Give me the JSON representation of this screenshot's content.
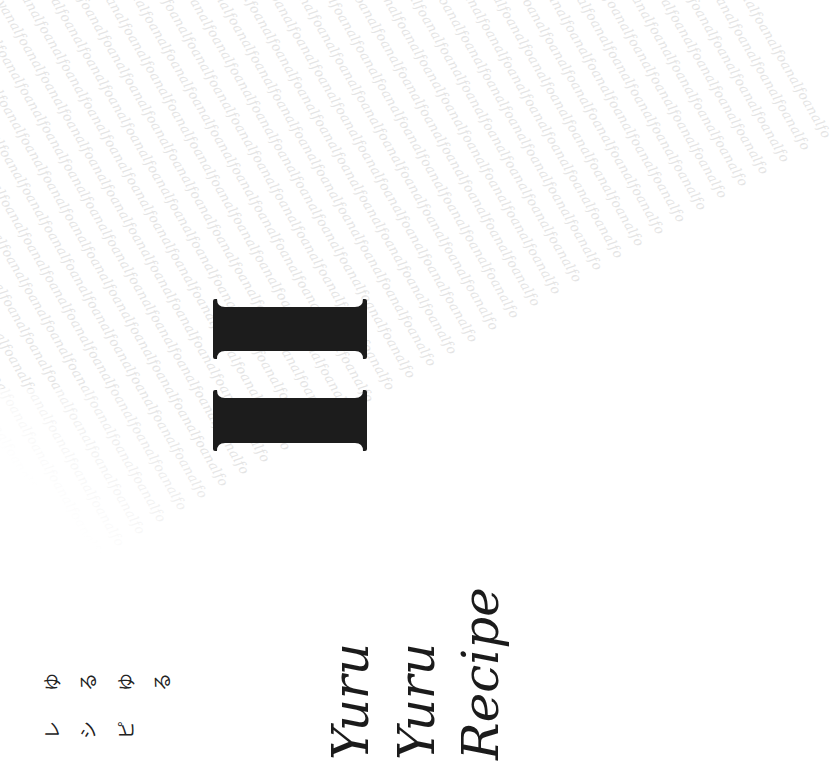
{
  "page": {
    "background_color": "#ffffff",
    "orientation": "rotated-90-ccw"
  },
  "watermark": {
    "text": "lyanalfoanalfoanalfoanalfoanalfoanalfoanalfoanalfoanalfoanalfoanalfoanalfo",
    "color": "#e4e4e4"
  },
  "numeral": {
    "value": "II",
    "color": "#1c1c1c"
  },
  "title": {
    "lines": [
      "Yuru",
      "Yuru",
      "Recipe"
    ],
    "color": "#1b1b1b"
  },
  "japanese_title": {
    "line1": [
      "ゆ",
      "る",
      "ゆ",
      "る"
    ],
    "line2": [
      "レ",
      "シ",
      "ピ"
    ]
  }
}
